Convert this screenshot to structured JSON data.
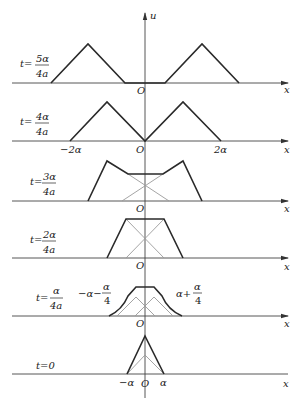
{
  "figure": {
    "vertical_axis_label": "u",
    "horizontal_axis_label": "x",
    "origin_label": "O",
    "colors": {
      "curve": "#2a2a2a",
      "component": "#9a9a9a",
      "axis": "#444444"
    }
  },
  "panels": [
    {
      "id": "t5",
      "time_prefix": "t=",
      "time_num": "5α",
      "time_den": "4a",
      "x_labels": []
    },
    {
      "id": "t4",
      "time_prefix": "t=",
      "time_num": "4α",
      "time_den": "4a",
      "x_labels": [
        "−2α",
        "2α"
      ]
    },
    {
      "id": "t3",
      "time_prefix": "t=",
      "time_num": "3α",
      "time_den": "4a",
      "x_labels": []
    },
    {
      "id": "t2",
      "time_prefix": "t=",
      "time_num": "2α",
      "time_den": "4a",
      "x_labels": []
    },
    {
      "id": "t1",
      "time_prefix": "t=",
      "time_num": "α",
      "time_den": "4a",
      "left_annot_prefix": "−α−",
      "left_annot_num": "α",
      "left_annot_den": "4",
      "right_annot_prefix": "α+",
      "right_annot_num": "α",
      "right_annot_den": "4"
    },
    {
      "id": "t0",
      "time_label": "t=0",
      "x_labels": [
        "−α",
        "α"
      ]
    }
  ]
}
